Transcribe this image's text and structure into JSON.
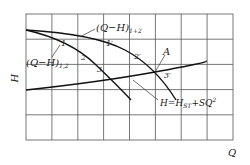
{
  "diagram": {
    "type": "pump-characteristic-curves",
    "axes": {
      "x_label": "Q",
      "y_label": "H"
    },
    "grid": {
      "columns": 8,
      "rows": 5
    },
    "curves": {
      "single_pump": {
        "label_main": "(Q−H)",
        "label_sub": "1,2"
      },
      "parallel_pumps": {
        "label_main": "(Q−H)",
        "label_sub": "1+2"
      },
      "system": {
        "label_prefix": "H=H",
        "label_sub": "ST",
        "label_suffix": "+SQ",
        "label_sup": "2"
      }
    },
    "points": {
      "p1": "1",
      "p2": "2",
      "p3": "3",
      "p1p": "1′",
      "p2p": "2′",
      "p3p": "3′",
      "A": "A"
    }
  }
}
